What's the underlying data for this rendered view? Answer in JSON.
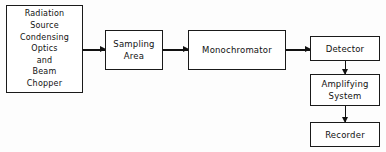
{
  "diagram": {
    "type": "block-flow-diagram",
    "background_color": "#fdfdfd",
    "line_color": "#111111",
    "boxes": [
      {
        "id": "source",
        "name": "radiation-source-box",
        "lines": [
          "Radiation",
          "Source",
          "Condensing",
          "Optics",
          "and",
          "Beam",
          "Chopper"
        ]
      },
      {
        "id": "sampling",
        "name": "sampling-area-box",
        "lines": [
          "Sampling",
          "Area"
        ]
      },
      {
        "id": "monochromator",
        "name": "monochromator-box",
        "lines": [
          "Monochromator"
        ]
      },
      {
        "id": "detector",
        "name": "detector-box",
        "lines": [
          "Detector"
        ]
      },
      {
        "id": "amplifier",
        "name": "amplifying-system-box",
        "lines": [
          "Amplifying",
          "System"
        ]
      },
      {
        "id": "recorder",
        "name": "recorder-box",
        "lines": [
          "Recorder"
        ]
      }
    ],
    "connectors": [
      {
        "id": "source-to-sampling",
        "from": "source",
        "to": "sampling",
        "direction": "right"
      },
      {
        "id": "sampling-to-monochromator",
        "from": "sampling",
        "to": "monochromator",
        "direction": "right"
      },
      {
        "id": "monochromator-to-detector",
        "from": "monochromator",
        "to": "detector",
        "direction": "right"
      },
      {
        "id": "detector-to-amplifier",
        "from": "detector",
        "to": "amplifier",
        "direction": "down"
      },
      {
        "id": "amplifier-to-recorder",
        "from": "amplifier",
        "to": "recorder",
        "direction": "down"
      }
    ]
  }
}
